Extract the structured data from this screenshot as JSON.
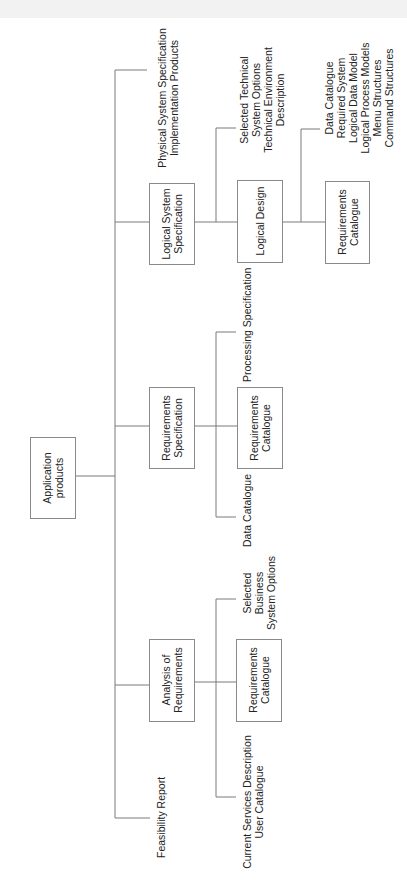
{
  "diagram": {
    "orientation": "rotated -90deg (tree grows left to right, text reads bottom-to-top)",
    "root": {
      "label": [
        "Application",
        "products"
      ]
    },
    "level1": [
      {
        "label": [
          "Logical System",
          "Specification"
        ],
        "children_box": {
          "label": [
            "Logical Design"
          ],
          "outputs": [
            "Selected Technical",
            "System Options",
            "Technical Environment",
            "Description"
          ],
          "children_box": {
            "label": [
              "Requirements",
              "Catalogue"
            ],
            "outputs": [
              "Data Catalogue",
              "Required System",
              "Logical Data Model",
              "Logical Process Models",
              "Menu Structures",
              "Command Structures"
            ]
          }
        }
      },
      {
        "label": [
          "Requirements",
          "Specification"
        ],
        "children_box": {
          "label": [
            "Requirements",
            "Catalogue"
          ]
        },
        "outputs_top": [
          "Processing Specification"
        ],
        "outputs_bottom": [
          "Data Catalogue"
        ]
      },
      {
        "label": [
          "Analysis of",
          "Requirements"
        ],
        "children_box": {
          "label": [
            "Requirements",
            "Catalogue"
          ]
        },
        "outputs_top": [
          "Selected",
          "Business",
          "System Options"
        ],
        "outputs_bottom": [
          "Current Services Description",
          "User Catalogue"
        ]
      }
    ],
    "leaf_top": [
      "Physical System Specification",
      "Implementation Products"
    ],
    "leaf_bottom": [
      "Feasibility Report"
    ],
    "colors": {
      "line": "#7a7a7a",
      "box_border": "#8a8a8a",
      "text": "#222222",
      "background": "#ffffff"
    }
  }
}
